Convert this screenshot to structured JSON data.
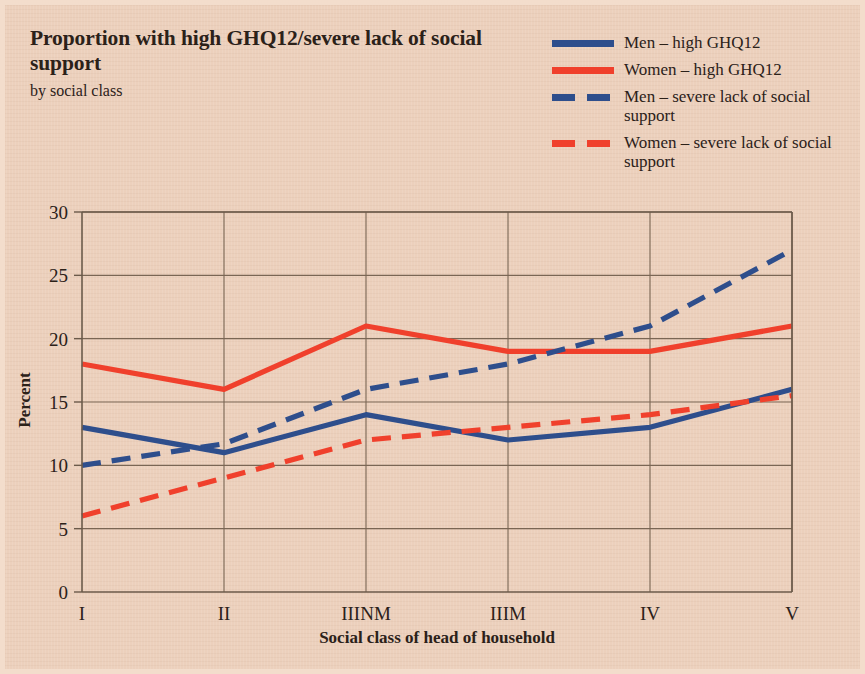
{
  "header": {
    "title": "Proportion with high GHQ12/severe lack of social support",
    "subtitle": "by social class"
  },
  "legend": {
    "position": "top-right",
    "items": [
      {
        "label": "Men – high GHQ12",
        "color": "#2e4e8c",
        "style": "solid",
        "swatch": "solid-blue"
      },
      {
        "label": "Women – high GHQ12",
        "color": "#f0402c",
        "style": "solid",
        "swatch": "solid-red"
      },
      {
        "label": "Men – severe lack of social support",
        "color": "#2e4e8c",
        "style": "dashed",
        "swatch": "dash-blue"
      },
      {
        "label": "Women – severe lack of social support",
        "color": "#f0402c",
        "style": "dashed",
        "swatch": "dash-red"
      }
    ]
  },
  "colors": {
    "background": "#ecd0bc",
    "border": "#f3ddcc",
    "blue": "#2e4e8c",
    "red": "#f0402c",
    "axis": "#6b5a4a",
    "grid": "#7a6654",
    "text": "#2b2119"
  },
  "chart_data": {
    "type": "line",
    "title": "Proportion with high GHQ12/severe lack of social support",
    "subtitle": "by social class",
    "xlabel": "Social class of head of household",
    "ylabel": "Percent",
    "categories": [
      "I",
      "II",
      "IIINM",
      "IIIM",
      "IV",
      "V"
    ],
    "yticks": [
      0,
      5,
      10,
      15,
      20,
      25,
      30
    ],
    "ylim": [
      0,
      30
    ],
    "grid": true,
    "legend_position": "top-right",
    "series": [
      {
        "name": "Men – high GHQ12",
        "color": "#2e4e8c",
        "style": "solid",
        "values": [
          13,
          11,
          14,
          12,
          13,
          16
        ]
      },
      {
        "name": "Women – high GHQ12",
        "color": "#f0402c",
        "style": "solid",
        "values": [
          18,
          16,
          21,
          19,
          19,
          21
        ]
      },
      {
        "name": "Men – severe lack of social support",
        "color": "#2e4e8c",
        "style": "dashed",
        "values": [
          10,
          11.7,
          16,
          18,
          21,
          27
        ]
      },
      {
        "name": "Women – severe lack of social support",
        "color": "#f0402c",
        "style": "dashed",
        "values": [
          6,
          9,
          12,
          13,
          14,
          15.5
        ]
      }
    ]
  }
}
